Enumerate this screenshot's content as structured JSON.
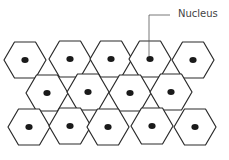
{
  "diagram": {
    "title": "",
    "label": "Nucleus",
    "colors": {
      "outline": "#2a2a2a",
      "nucleus": "#1a1a1a",
      "leader": "#555555",
      "background": "#ffffff"
    },
    "cells": [
      {
        "row": 1,
        "cx": 25,
        "cy": 60
      },
      {
        "row": 1,
        "cx": 70,
        "cy": 59
      },
      {
        "row": 1,
        "cx": 111,
        "cy": 59
      },
      {
        "row": 1,
        "cx": 150,
        "cy": 59
      },
      {
        "row": 1,
        "cx": 193,
        "cy": 60
      },
      {
        "row": 2,
        "cx": 47,
        "cy": 93
      },
      {
        "row": 2,
        "cx": 88,
        "cy": 92
      },
      {
        "row": 2,
        "cx": 130,
        "cy": 93
      },
      {
        "row": 2,
        "cx": 171,
        "cy": 92
      },
      {
        "row": 3,
        "cx": 29,
        "cy": 127
      },
      {
        "row": 3,
        "cx": 70,
        "cy": 126
      },
      {
        "row": 3,
        "cx": 108,
        "cy": 127
      },
      {
        "row": 3,
        "cx": 152,
        "cy": 126
      },
      {
        "row": 3,
        "cx": 195,
        "cy": 127
      }
    ]
  }
}
